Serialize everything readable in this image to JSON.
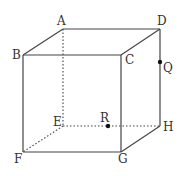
{
  "diagram": {
    "type": "cube",
    "vertices": {
      "A": {
        "label": "A",
        "x": 63,
        "y": 29,
        "lx": 57,
        "ly": 25
      },
      "B": {
        "label": "B",
        "x": 23,
        "y": 55,
        "lx": 12,
        "ly": 59
      },
      "C": {
        "label": "C",
        "x": 121,
        "y": 55,
        "lx": 125,
        "ly": 64
      },
      "D": {
        "label": "D",
        "x": 160,
        "y": 29,
        "lx": 157,
        "ly": 25
      },
      "E": {
        "label": "E",
        "x": 63,
        "y": 126,
        "lx": 53,
        "ly": 126
      },
      "F": {
        "label": "F",
        "x": 23,
        "y": 152,
        "lx": 14,
        "ly": 163
      },
      "G": {
        "label": "G",
        "x": 121,
        "y": 152,
        "lx": 118,
        "ly": 163
      },
      "H": {
        "label": "H",
        "x": 160,
        "y": 126,
        "lx": 163,
        "ly": 131
      }
    },
    "points": {
      "Q": {
        "label": "Q",
        "x": 160,
        "y": 62,
        "lx": 163,
        "ly": 72,
        "on_edge": "DH"
      },
      "R": {
        "label": "R",
        "x": 108,
        "y": 126,
        "lx": 100,
        "ly": 122,
        "on_edge": "EH"
      }
    },
    "visible_edges": [
      "AB",
      "AD",
      "BC",
      "CD",
      "BF",
      "CG",
      "DH",
      "FG",
      "GH"
    ],
    "hidden_edges": [
      "AE",
      "EF",
      "EH"
    ]
  }
}
